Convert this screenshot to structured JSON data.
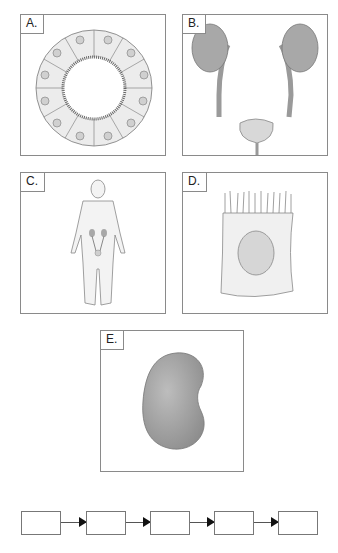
{
  "panels": [
    {
      "id": "A",
      "label": "A.",
      "depicts": "epithelial-tubule-cross-section"
    },
    {
      "id": "B",
      "label": "B.",
      "depicts": "kidneys-ureters-bladder"
    },
    {
      "id": "C",
      "label": "C.",
      "depicts": "human-body-urinary-system"
    },
    {
      "id": "D",
      "label": "D.",
      "depicts": "epithelial-cell-with-microvilli"
    },
    {
      "id": "E",
      "label": "E.",
      "depicts": "kidney"
    }
  ],
  "flow": {
    "boxes": [
      "",
      "",
      "",
      "",
      ""
    ],
    "arrow_count": 4
  },
  "colors": {
    "border": "#8a8a8a",
    "organ_fill": "#a8a8a8",
    "cell_fill": "#ececec",
    "nucleus_fill": "#d6d6d6",
    "arrow": "#111111"
  }
}
